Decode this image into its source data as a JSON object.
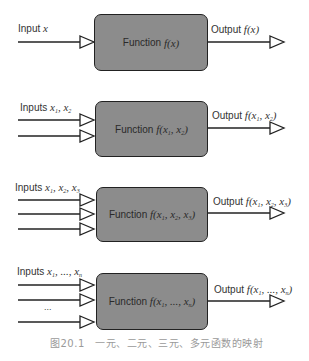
{
  "figure": {
    "caption": "图20.1　一元、二元、三元、多元函数的映射",
    "box_color": "#8c8c8c",
    "border_color": "#222222",
    "diagrams": [
      {
        "input_label_prefix": "Inputs",
        "input_label_math": "x",
        "function_label_prefix": "Function",
        "function_label_math": "f(x)",
        "output_label_prefix": "Output",
        "output_label_math": "f(x)",
        "input_count": 1
      },
      {
        "input_label_prefix": "Inputs",
        "input_label_math": "x1, x2",
        "function_label_prefix": "Function",
        "function_label_math": "f(x1, x2)",
        "output_label_prefix": "Output",
        "output_label_math": "f(x1, x2)",
        "input_count": 2
      },
      {
        "input_label_prefix": "Inputs",
        "input_label_math": "x1, x2, x3",
        "function_label_prefix": "Function",
        "function_label_math": "f(x1, x2, x3)",
        "output_label_prefix": "Output",
        "output_label_math": "f(x1, x2, x3)",
        "input_count": 3
      },
      {
        "input_label_prefix": "Inputs",
        "input_label_math": "x1, ..., xn",
        "function_label_prefix": "Function",
        "function_label_math": "f(x1, ..., xn)",
        "output_label_prefix": "Output",
        "output_label_math": "f(x1, ..., xn)",
        "input_count": "n",
        "ellipsis": "..."
      }
    ],
    "labels": {
      "d1_input": "Input",
      "d1_function": "Function",
      "d1_output": "Output",
      "d2_input": "Inputs",
      "d2_function": "Function",
      "d2_output": "Output",
      "d3_input": "Inputs",
      "d3_function": "Function",
      "d3_output": "Output",
      "d4_input": "Inputs",
      "d4_function": "Function",
      "d4_output": "Output",
      "ellipsis": "...",
      "x": "x",
      "f": "f",
      "n": "n",
      "one": "1",
      "two": "2",
      "three": "3",
      "comma_dots": ", ..., "
    }
  }
}
